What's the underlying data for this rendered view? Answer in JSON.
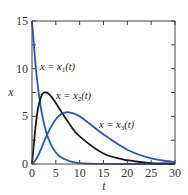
{
  "chart_data": {
    "type": "line",
    "title": "",
    "xlabel": "t",
    "ylabel": "x",
    "xlim": [
      0,
      30
    ],
    "ylim": [
      0,
      15
    ],
    "xticks": [
      0,
      5,
      10,
      15,
      20,
      25,
      30
    ],
    "yticks": [
      0,
      5,
      10,
      15
    ],
    "grid": false,
    "legend": "inline curve labels",
    "series": [
      {
        "name": "x = x1(t)",
        "color": "#2458c6",
        "x": [
          0,
          1,
          2,
          3,
          4,
          5,
          6,
          8,
          10,
          15,
          20,
          25,
          30
        ],
        "values": [
          15,
          9.1,
          5.5,
          3.3,
          2.0,
          1.2,
          0.74,
          0.27,
          0.1,
          0.01,
          0,
          0,
          0
        ]
      },
      {
        "name": "x = x2(t)",
        "color": "#1a1a1a",
        "x": [
          0,
          1,
          2,
          3,
          4,
          5,
          6,
          8,
          10,
          15,
          20,
          25,
          30
        ],
        "values": [
          0,
          5.0,
          7.2,
          7.5,
          7.1,
          6.4,
          5.6,
          4.1,
          2.9,
          1.1,
          0.4,
          0.1,
          0.05
        ]
      },
      {
        "name": "x = x3(t)",
        "color": "#2458c6",
        "x": [
          0,
          1,
          2,
          3,
          4,
          5,
          6,
          7,
          8,
          10,
          15,
          20,
          25,
          30
        ],
        "values": [
          0,
          0.6,
          1.7,
          2.9,
          3.9,
          4.7,
          5.2,
          5.4,
          5.4,
          5.0,
          3.1,
          1.5,
          0.6,
          0.2
        ]
      }
    ],
    "annotations": [
      {
        "text": "x = x1(t)",
        "t": 3.2,
        "x": 10.3
      },
      {
        "text": "x = x2(t)",
        "t": 6.2,
        "x": 7.4
      },
      {
        "text": "x = x3(t)",
        "t": 13.0,
        "x": 4.9
      }
    ]
  },
  "labels": {
    "x_axis": "t",
    "y_axis": "x",
    "curve1": "x = x",
    "curve1_sub": "1",
    "curve1_tail": "(t)",
    "curve2": "x = x",
    "curve2_sub": "2",
    "curve2_tail": "(t)",
    "curve3": "x = x",
    "curve3_sub": "3",
    "curve3_tail": "(t)"
  }
}
